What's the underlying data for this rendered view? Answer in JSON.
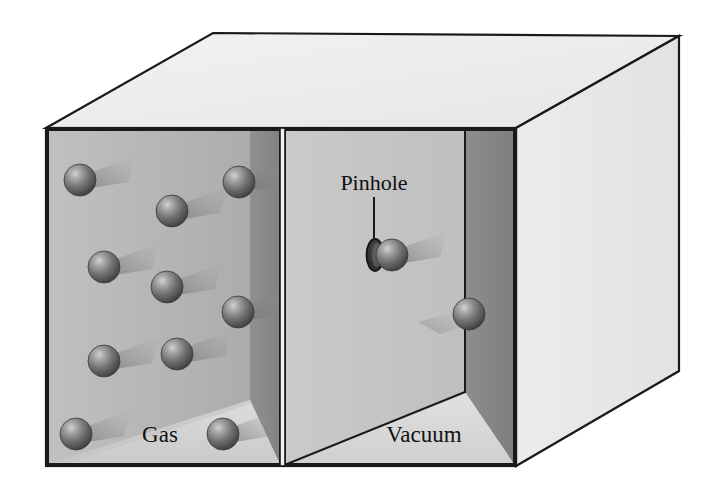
{
  "figure": {
    "background_color": "#ffffff",
    "outline_color": "#1a1a1a"
  },
  "labels": {
    "gas": "Gas",
    "vacuum": "Vacuum",
    "pinhole": "Pinhole"
  },
  "colors": {
    "top_face": "#ededed",
    "right_face": "#e9e9e9",
    "gas_back_wall": "#b4b4b4",
    "gas_side_wall": "#8e8e8e",
    "gas_floor": "#d2d2d2",
    "vacuum_back_wall": "#c2c2c2",
    "vacuum_side_wall": "#8a8a8a",
    "vacuum_floor": "#d8d8d8",
    "molecule_dark": "#4a4a4a",
    "molecule_light": "#c8c8c8",
    "pinhole_dark": "#2e2e2e",
    "outline": "#1a1a1a"
  },
  "geometry": {
    "front_face": {
      "left": 46,
      "top": 128,
      "right": 516,
      "bottom": 466
    },
    "top_back_left": {
      "x": 213,
      "y": 33
    },
    "top_back_right": {
      "x": 679,
      "y": 36
    },
    "bottom_back_right": {
      "x": 679,
      "y": 371
    },
    "divider_x": 282,
    "vacuum_inner_right_x": 465,
    "gas_inner_right_x": 250
  },
  "molecules": {
    "count_in_gas": 10,
    "radius": 16,
    "positions": [
      {
        "id": "m1",
        "cx": 80,
        "cy": 180,
        "r": 16,
        "chamber": "gas"
      },
      {
        "id": "m2",
        "cx": 172,
        "cy": 211,
        "r": 16,
        "chamber": "gas"
      },
      {
        "id": "m3",
        "cx": 239,
        "cy": 182,
        "r": 16,
        "chamber": "gas"
      },
      {
        "id": "m4",
        "cx": 104,
        "cy": 267,
        "r": 16,
        "chamber": "gas"
      },
      {
        "id": "m5",
        "cx": 167,
        "cy": 287,
        "r": 16,
        "chamber": "gas"
      },
      {
        "id": "m6",
        "cx": 238,
        "cy": 312,
        "r": 16,
        "chamber": "gas"
      },
      {
        "id": "m7",
        "cx": 104,
        "cy": 361,
        "r": 16,
        "chamber": "gas"
      },
      {
        "id": "m8",
        "cx": 177,
        "cy": 354,
        "r": 16,
        "chamber": "gas"
      },
      {
        "id": "m9",
        "cx": 76,
        "cy": 434,
        "r": 16,
        "chamber": "gas"
      },
      {
        "id": "m10",
        "cx": 223,
        "cy": 434,
        "r": 16,
        "chamber": "gas"
      },
      {
        "id": "m11",
        "cx": 392,
        "cy": 255,
        "r": 16,
        "chamber": "pinhole-exit"
      },
      {
        "id": "m12",
        "cx": 469,
        "cy": 314,
        "r": 16,
        "chamber": "vacuum"
      }
    ]
  },
  "pinhole": {
    "cx": 375,
    "cy": 255,
    "rx": 8,
    "ry": 16,
    "leader_line": {
      "x1": 374,
      "y1": 197,
      "x2": 374,
      "y2": 238
    }
  },
  "label_positions": {
    "gas": {
      "x": 160,
      "y": 442
    },
    "vacuum": {
      "x": 424,
      "y": 442
    },
    "pinhole": {
      "x": 374,
      "y": 190
    }
  }
}
